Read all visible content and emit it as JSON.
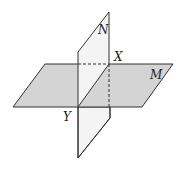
{
  "diagram": {
    "type": "intersecting-planes",
    "labels": {
      "plane_vertical": "N",
      "plane_horizontal": "M",
      "point_top": "X",
      "point_bottom": "Y"
    },
    "colors": {
      "plane_m_fill": "#d3d3d3",
      "plane_n_fill": "#f2f2f2",
      "stroke": "#333333"
    }
  }
}
